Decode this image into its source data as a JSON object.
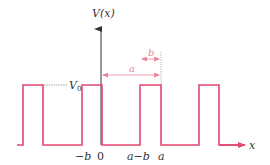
{
  "diagram": {
    "y_axis_label": "V(x)",
    "x_axis_label": "x",
    "level_label": "V",
    "level_label_subscript": "0",
    "tick_labels": {
      "minus_b": "−b",
      "zero": "0",
      "a_minus_b": "a−b",
      "a": "a"
    },
    "dimension_labels": {
      "period": "a",
      "barrier_width": "b"
    },
    "colors": {
      "potential_line": "#e4476f",
      "dimension_annotation": "#e8869c",
      "axis": "#333333",
      "guide_dotted": "#555555"
    }
  }
}
